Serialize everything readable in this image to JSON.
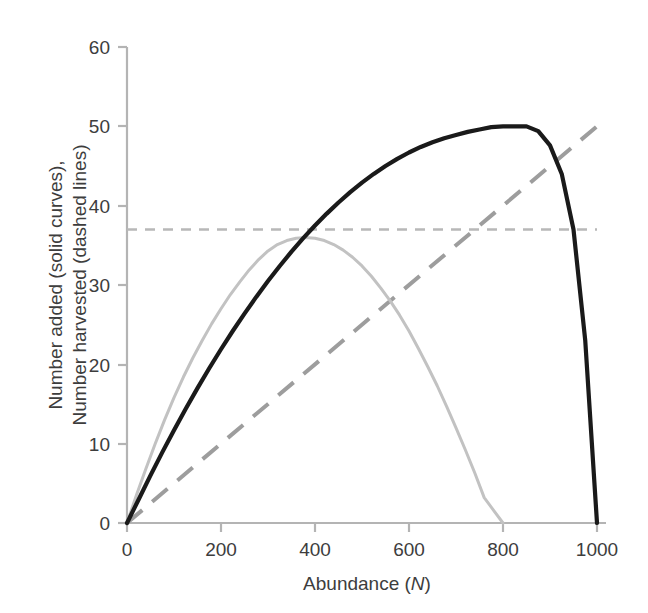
{
  "chart_data": {
    "type": "line",
    "title": "",
    "xlabel": "Abundance (N)",
    "xlabel_plain": "Abundance (",
    "xlabel_italic": "N",
    "xlabel_close": ")",
    "ylabel_line1": "Number added (solid curves),",
    "ylabel_line2": "Number harvested (dashed lines)",
    "xlim": [
      0,
      1000
    ],
    "ylim": [
      0,
      60
    ],
    "xticks": [
      0,
      200,
      400,
      600,
      800,
      1000
    ],
    "yticks": [
      0,
      10,
      20,
      30,
      40,
      50,
      60
    ],
    "xtick_labels": [
      "0",
      "200",
      "400",
      "600",
      "800",
      "1000"
    ],
    "ytick_labels": [
      "0",
      "10",
      "20",
      "30",
      "40",
      "50",
      "60"
    ],
    "grid": false,
    "legend": "none",
    "colors": {
      "series_black": "#1a1a1a",
      "series_grey": "#c2c2c2",
      "dashed_diagonal": "#9d9d9d",
      "dashed_horizontal": "#b8b8b8",
      "axis": "#b4b4b4",
      "text": "#3d3d3d",
      "background": "#ffffff"
    },
    "series": [
      {
        "name": "Number added (high productivity)",
        "style": "solid",
        "color": "#1a1a1a",
        "description": "Recruitment curve peaking at 50 near N=490, zero at N=0 and N=1000",
        "x": [
          0,
          25,
          50,
          75,
          100,
          125,
          150,
          175,
          200,
          225,
          250,
          275,
          300,
          325,
          350,
          375,
          400,
          425,
          450,
          475,
          500,
          525,
          550,
          575,
          600,
          625,
          650,
          675,
          700,
          725,
          750,
          775,
          800,
          825,
          850,
          875,
          900,
          925,
          950,
          975,
          1000
        ],
        "y": [
          0,
          3.0,
          6.0,
          8.9,
          11.7,
          14.4,
          17.0,
          19.5,
          21.9,
          24.2,
          26.4,
          28.5,
          30.5,
          32.4,
          34.2,
          35.9,
          37.5,
          39.0,
          40.4,
          41.7,
          42.9,
          44.0,
          45.0,
          45.9,
          46.7,
          47.4,
          48.0,
          48.5,
          48.9,
          49.3,
          49.6,
          49.9,
          50.0,
          50.0,
          50.0,
          49.4,
          47.6,
          44.0,
          37.0,
          23.0,
          0
        ]
      },
      {
        "name": "Number added (low productivity)",
        "style": "solid",
        "color": "#c2c2c2",
        "description": "Recruitment curve peaking at 36 near N=400, zero at N=0 and N=800",
        "x": [
          0,
          20,
          40,
          60,
          80,
          100,
          120,
          140,
          160,
          180,
          200,
          220,
          240,
          260,
          280,
          300,
          320,
          340,
          360,
          380,
          400,
          420,
          440,
          460,
          480,
          500,
          520,
          540,
          560,
          580,
          600,
          620,
          640,
          660,
          680,
          700,
          720,
          740,
          760,
          780,
          800
        ],
        "y": [
          0,
          3.5,
          6.8,
          10.0,
          13.0,
          15.8,
          18.4,
          20.8,
          23.0,
          25.1,
          27.0,
          28.8,
          30.4,
          31.9,
          33.2,
          34.3,
          35.1,
          35.6,
          35.9,
          36.0,
          35.9,
          35.6,
          35.1,
          34.4,
          33.5,
          32.4,
          31.1,
          29.6,
          28.0,
          26.2,
          24.2,
          22.0,
          19.7,
          17.3,
          14.7,
          12.0,
          9.2,
          6.3,
          3.2,
          1.6,
          0
        ]
      }
    ],
    "reference_lines": [
      {
        "name": "Proportional harvest (dashed diagonal)",
        "style": "dashed",
        "color": "#9d9d9d",
        "type": "linear",
        "slope": 0.05,
        "intercept": 0,
        "from": [
          0,
          0
        ],
        "to": [
          1000,
          50
        ]
      },
      {
        "name": "Constant harvest (dashed horizontal)",
        "style": "dashed",
        "color": "#b8b8b8",
        "type": "horizontal",
        "value": 37,
        "from": [
          0,
          37
        ],
        "to": [
          1000,
          37
        ]
      }
    ],
    "annotations": []
  }
}
